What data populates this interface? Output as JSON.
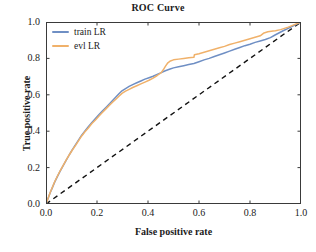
{
  "chart_data": {
    "type": "line",
    "title": "ROC Curve",
    "xlabel": "False positive rate",
    "ylabel": "True positive rate",
    "xlim": [
      0.0,
      1.0
    ],
    "ylim": [
      0.0,
      1.0
    ],
    "xticks": [
      "0.0",
      "0.2",
      "0.4",
      "0.6",
      "0.8",
      "1.0"
    ],
    "yticks": [
      "0.0",
      "0.2",
      "0.4",
      "0.6",
      "0.8",
      "1.0"
    ],
    "xtick_values": [
      0.0,
      0.2,
      0.4,
      0.6,
      0.8,
      1.0
    ],
    "ytick_values": [
      0.0,
      0.2,
      0.4,
      0.6,
      0.8,
      1.0
    ],
    "grid": false,
    "legend_position": "upper left",
    "series": [
      {
        "name": "train LR",
        "color": "#6f8fc4",
        "style": "solid",
        "points": [
          [
            0.0,
            0.0
          ],
          [
            0.008,
            0.03
          ],
          [
            0.016,
            0.06
          ],
          [
            0.025,
            0.09
          ],
          [
            0.034,
            0.12
          ],
          [
            0.045,
            0.152
          ],
          [
            0.056,
            0.182
          ],
          [
            0.068,
            0.212
          ],
          [
            0.08,
            0.242
          ],
          [
            0.092,
            0.272
          ],
          [
            0.104,
            0.3
          ],
          [
            0.116,
            0.326
          ],
          [
            0.128,
            0.352
          ],
          [
            0.14,
            0.378
          ],
          [
            0.152,
            0.4
          ],
          [
            0.166,
            0.424
          ],
          [
            0.18,
            0.448
          ],
          [
            0.194,
            0.47
          ],
          [
            0.208,
            0.492
          ],
          [
            0.222,
            0.512
          ],
          [
            0.236,
            0.532
          ],
          [
            0.25,
            0.552
          ],
          [
            0.262,
            0.57
          ],
          [
            0.274,
            0.588
          ],
          [
            0.286,
            0.606
          ],
          [
            0.298,
            0.622
          ],
          [
            0.312,
            0.634
          ],
          [
            0.326,
            0.646
          ],
          [
            0.34,
            0.656
          ],
          [
            0.356,
            0.666
          ],
          [
            0.372,
            0.676
          ],
          [
            0.388,
            0.686
          ],
          [
            0.404,
            0.694
          ],
          [
            0.42,
            0.702
          ],
          [
            0.436,
            0.712
          ],
          [
            0.452,
            0.722
          ],
          [
            0.468,
            0.732
          ],
          [
            0.484,
            0.74
          ],
          [
            0.5,
            0.748
          ],
          [
            0.52,
            0.754
          ],
          [
            0.54,
            0.76
          ],
          [
            0.56,
            0.766
          ],
          [
            0.58,
            0.772
          ],
          [
            0.6,
            0.782
          ],
          [
            0.62,
            0.792
          ],
          [
            0.64,
            0.8
          ],
          [
            0.66,
            0.81
          ],
          [
            0.68,
            0.82
          ],
          [
            0.7,
            0.83
          ],
          [
            0.72,
            0.84
          ],
          [
            0.74,
            0.85
          ],
          [
            0.76,
            0.86
          ],
          [
            0.78,
            0.87
          ],
          [
            0.8,
            0.878
          ],
          [
            0.82,
            0.888
          ],
          [
            0.84,
            0.896
          ],
          [
            0.86,
            0.904
          ],
          [
            0.88,
            0.914
          ],
          [
            0.9,
            0.93
          ],
          [
            0.93,
            0.952
          ],
          [
            0.96,
            0.972
          ],
          [
            1.0,
            1.0
          ]
        ]
      },
      {
        "name": "evl LR",
        "color": "#f0b16a",
        "style": "solid",
        "points": [
          [
            0.0,
            0.0
          ],
          [
            0.008,
            0.03
          ],
          [
            0.016,
            0.062
          ],
          [
            0.025,
            0.092
          ],
          [
            0.034,
            0.122
          ],
          [
            0.045,
            0.154
          ],
          [
            0.056,
            0.184
          ],
          [
            0.068,
            0.214
          ],
          [
            0.08,
            0.244
          ],
          [
            0.092,
            0.272
          ],
          [
            0.104,
            0.298
          ],
          [
            0.116,
            0.322
          ],
          [
            0.128,
            0.348
          ],
          [
            0.14,
            0.374
          ],
          [
            0.152,
            0.396
          ],
          [
            0.166,
            0.418
          ],
          [
            0.18,
            0.442
          ],
          [
            0.194,
            0.462
          ],
          [
            0.208,
            0.484
          ],
          [
            0.222,
            0.504
          ],
          [
            0.236,
            0.524
          ],
          [
            0.25,
            0.544
          ],
          [
            0.262,
            0.56
          ],
          [
            0.274,
            0.576
          ],
          [
            0.286,
            0.592
          ],
          [
            0.298,
            0.608
          ],
          [
            0.312,
            0.62
          ],
          [
            0.326,
            0.63
          ],
          [
            0.34,
            0.64
          ],
          [
            0.356,
            0.65
          ],
          [
            0.372,
            0.66
          ],
          [
            0.388,
            0.67
          ],
          [
            0.404,
            0.68
          ],
          [
            0.42,
            0.692
          ],
          [
            0.436,
            0.706
          ],
          [
            0.452,
            0.722
          ],
          [
            0.462,
            0.742
          ],
          [
            0.47,
            0.76
          ],
          [
            0.478,
            0.776
          ],
          [
            0.488,
            0.786
          ],
          [
            0.5,
            0.792
          ],
          [
            0.52,
            0.796
          ],
          [
            0.54,
            0.8
          ],
          [
            0.56,
            0.804
          ],
          [
            0.58,
            0.806
          ],
          [
            0.582,
            0.82
          ],
          [
            0.6,
            0.826
          ],
          [
            0.62,
            0.834
          ],
          [
            0.64,
            0.842
          ],
          [
            0.66,
            0.85
          ],
          [
            0.68,
            0.858
          ],
          [
            0.7,
            0.866
          ],
          [
            0.72,
            0.876
          ],
          [
            0.74,
            0.884
          ],
          [
            0.76,
            0.892
          ],
          [
            0.78,
            0.9
          ],
          [
            0.8,
            0.908
          ],
          [
            0.82,
            0.916
          ],
          [
            0.84,
            0.924
          ],
          [
            0.855,
            0.94
          ],
          [
            0.87,
            0.946
          ],
          [
            0.89,
            0.95
          ],
          [
            0.9,
            0.952
          ],
          [
            0.92,
            0.958
          ],
          [
            0.95,
            0.972
          ],
          [
            1.0,
            1.0
          ]
        ]
      }
    ],
    "reference_line": {
      "name": "chance",
      "style": "dashed",
      "color": "#111111",
      "points": [
        [
          0.0,
          0.0
        ],
        [
          1.0,
          1.0
        ]
      ]
    }
  }
}
